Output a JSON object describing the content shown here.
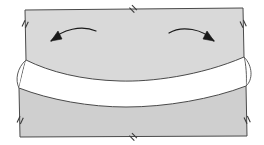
{
  "figure": {
    "title": "",
    "caption": "",
    "type": "geometric-diagram",
    "background_color": "#ffffff"
  },
  "colors": {
    "upper_band_fill": "#d9d9d9",
    "lower_band_fill": "#cfcfcf",
    "gap_fill": "#ffffff",
    "stroke": "#4a4a4a",
    "arrow_color": "#1a1a1a",
    "tick_color": "#3a3a3a"
  },
  "shapes": {
    "upper_band": {
      "name": "upper-band",
      "fill": "#d9d9d9",
      "path": "M 25 10 L 243 8 L 244 57 C 200 76 150 82 120 81 C 82 80 50 72 26 60 Z"
    },
    "lower_band": {
      "name": "lower-band",
      "fill": "#cfcfcf",
      "path": "M 19 88 C 50 100 90 107 126 107 C 166 107 212 99 246 86 L 247 136 L 20 137 Z"
    },
    "gap_region": {
      "name": "white-gap",
      "fill": "#ffffff",
      "path": "M 26 60 C 50 72 82 80 120 81 C 150 82 200 76 244 57 L 246 86 C 212 99 166 107 126 107 C 90 107 50 100 19 88 Z"
    },
    "left_lens": {
      "name": "left-lens-connector",
      "fill": "#ffffff",
      "path": "M 26 60 C 17 68 15 80 19 88 C 21 80 23 68 26 60 Z"
    },
    "right_lens": {
      "name": "right-lens-connector",
      "fill": "#ffffff",
      "path": "M 244 57 C 253 66 253 80 246 86 C 247 76 246 64 244 57 Z"
    }
  },
  "arrows": [
    {
      "name": "left-rotation-arrow",
      "direction": "counter-clockwise",
      "path": "M 96 31 C 82 25 62 29 51 41",
      "head_points": "51,41 62,39 58,31",
      "color": "#1a1a1a"
    },
    {
      "name": "right-rotation-arrow",
      "direction": "clockwise",
      "path": "M 169 33 C 182 25 203 29 214 41",
      "head_points": "214,41 203,39 207,31",
      "color": "#1a1a1a"
    }
  ],
  "tick_marks": [
    {
      "name": "tick-top-center",
      "x": 133,
      "y": 9,
      "angle": 45
    },
    {
      "name": "tick-left-upper",
      "x": 25,
      "y": 24,
      "angle": 115
    },
    {
      "name": "tick-right-upper",
      "x": 243,
      "y": 24,
      "angle": 65
    },
    {
      "name": "tick-left-lower",
      "x": 20,
      "y": 120,
      "angle": 115
    },
    {
      "name": "tick-right-lower",
      "x": 247,
      "y": 120,
      "angle": 65
    },
    {
      "name": "tick-bottom-center",
      "x": 133,
      "y": 137,
      "angle": 45
    }
  ]
}
